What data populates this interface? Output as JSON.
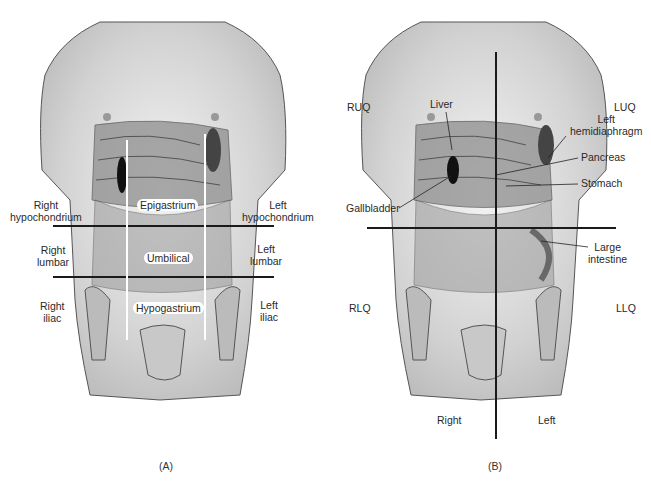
{
  "figure": {
    "panels": [
      {
        "id": "A",
        "caption": "(A)",
        "title": "Nine abdominal regions",
        "regions": {
          "right_hypochondrium": [
            "Right",
            "hypochondrium"
          ],
          "epigastrium": "Epigastrium",
          "left_hypochondrium": [
            "Left",
            "hypochondrium"
          ],
          "right_lumbar": [
            "Right",
            "lumbar"
          ],
          "umbilical": "Umbilical",
          "left_lumbar": [
            "Left",
            "lumbar"
          ],
          "right_iliac": [
            "Right",
            "iliac"
          ],
          "hypogastrium": "Hypogastrium",
          "left_iliac": [
            "Left",
            "iliac"
          ]
        }
      },
      {
        "id": "B",
        "caption": "(B)",
        "title": "Four abdominal quadrants",
        "quadrants": {
          "ruq": "RUQ",
          "luq": "LUQ",
          "rlq": "RLQ",
          "llq": "LLQ"
        },
        "organs": {
          "liver": "Liver",
          "left_hemidiaphragm": [
            "Left",
            "hemidiaphragm"
          ],
          "pancreas": "Pancreas",
          "stomach": "Stomach",
          "gallbladder": "Gallbladder",
          "large_intestine": [
            "Large",
            "intestine"
          ]
        },
        "sides": {
          "right": "Right",
          "left": "Left"
        }
      }
    ],
    "colors": {
      "skin_shade": "#c8c8c8",
      "organ_shade": "#8a8a8a",
      "line": "#1a1a1a",
      "text": "#2a2a2a"
    }
  }
}
